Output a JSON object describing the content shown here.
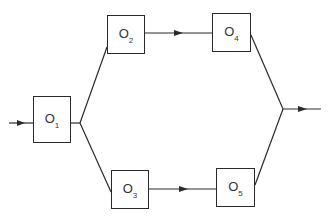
{
  "diagram": {
    "type": "parallel-flow",
    "colors": {
      "stroke": "#2a2a2a",
      "background": "#ffffff"
    },
    "nodes": [
      {
        "id": "O1",
        "base": "O",
        "sub": "1"
      },
      {
        "id": "O2",
        "base": "O",
        "sub": "2"
      },
      {
        "id": "O3",
        "base": "O",
        "sub": "3"
      },
      {
        "id": "O4",
        "base": "O",
        "sub": "4"
      },
      {
        "id": "O5",
        "base": "O",
        "sub": "5"
      }
    ],
    "edges": [
      {
        "from": "input",
        "to": "O1",
        "arrow": true
      },
      {
        "from": "O1",
        "to": "split-junction",
        "arrow": false
      },
      {
        "from": "split-junction",
        "to": "O2",
        "arrow": false
      },
      {
        "from": "split-junction",
        "to": "O3",
        "arrow": false
      },
      {
        "from": "O2",
        "to": "O4",
        "arrow": true
      },
      {
        "from": "O3",
        "to": "O5",
        "arrow": true
      },
      {
        "from": "O4",
        "to": "merge-junction",
        "arrow": false
      },
      {
        "from": "O5",
        "to": "merge-junction",
        "arrow": false
      },
      {
        "from": "merge-junction",
        "to": "output",
        "arrow": true
      }
    ]
  }
}
